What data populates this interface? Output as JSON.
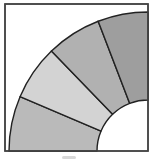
{
  "diagram": {
    "type": "quarter-annulus",
    "frame": {
      "x": 5,
      "y": 4,
      "width": 143,
      "height": 147,
      "stroke": "#444444"
    },
    "center": {
      "x": 148,
      "y": 151
    },
    "outer_radius": 139,
    "inner_radius": 51,
    "stroke_color": "#222222",
    "segments": [
      {
        "id": "segment-1",
        "start_deg": 0,
        "end_deg": 23,
        "fill": "#bababa"
      },
      {
        "id": "segment-2",
        "start_deg": 23,
        "end_deg": 46,
        "fill": "#d3d3d3"
      },
      {
        "id": "segment-3",
        "start_deg": 46,
        "end_deg": 69,
        "fill": "#b1b1b1"
      },
      {
        "id": "segment-4",
        "start_deg": 69,
        "end_deg": 90,
        "fill": "#9e9e9e"
      }
    ]
  }
}
